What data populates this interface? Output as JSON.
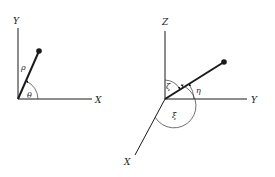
{
  "diagrams": {
    "polar_2d": {
      "axes": {
        "x_label": "X",
        "y_label": "Y"
      },
      "vector_label": "ρ",
      "angle_label": "θ"
    },
    "spherical_3d": {
      "axes": {
        "x_label": "X",
        "y_label": "Y",
        "z_label": "Z"
      },
      "angle_labels": {
        "zeta": "ζ",
        "eta": "η",
        "xi": "ξ"
      }
    }
  },
  "colors": {
    "line": "#1a1a1a",
    "thin_line": "#333333",
    "background": "#ffffff"
  }
}
